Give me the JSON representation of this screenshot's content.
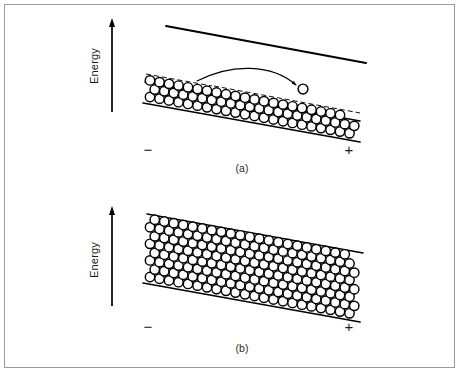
{
  "figure": {
    "width": 460,
    "height": 373,
    "background_color": "#ffffff",
    "border_color": "#9a9a9a",
    "ink_color": "#000000"
  },
  "panels": [
    {
      "id": "a",
      "caption": "(a)",
      "caption_x": 242,
      "caption_y": 172,
      "description": "Partially filled band with one particle excited above the band edge",
      "energy_axis": {
        "label": "Energy",
        "label_x": 98,
        "label_y": 66,
        "arrow_x": 112,
        "arrow_top_y": 18,
        "arrow_bottom_y": 112
      },
      "polarity_left": {
        "sign": "−",
        "x": 148,
        "y": 155
      },
      "polarity_right": {
        "sign": "+",
        "x": 349,
        "y": 155
      },
      "vacuum_line": {
        "x1": 166,
        "y1": 26,
        "x2": 366,
        "y2": 63
      },
      "band_top_line": {
        "x1": 145,
        "y1": 82,
        "x2": 360,
        "y2": 121,
        "width": 1.5
      },
      "band_bottom_line": {
        "x1": 143,
        "y1": 103,
        "x2": 360,
        "y2": 142,
        "width": 1.7
      },
      "dashed_edge": {
        "x1": 146,
        "y1": 74,
        "x2": 212,
        "y2": 86
      },
      "upper_thin_line": {
        "x1": 214,
        "y1": 86,
        "x2": 360,
        "y2": 113
      },
      "lattice": {
        "circle_radius": 4.7,
        "spacing_x": 9.5,
        "row_offset_y": 8.3,
        "origin_x": 150,
        "origin_y": 97,
        "slope": 0.182,
        "rows": [
          {
            "count": 22,
            "shift_x": 0.0
          },
          {
            "count": 22,
            "shift_x": 4.75
          },
          {
            "count": 21,
            "shift_x": 0.0
          }
        ]
      },
      "free_particle": {
        "cx": 303,
        "cy": 89,
        "r": 4.9
      },
      "transition_arrow": {
        "start_x": 197,
        "start_y": 81,
        "control1_x": 232,
        "control1_y": 63,
        "control2_x": 272,
        "control2_y": 64,
        "end_x": 296,
        "end_y": 85,
        "head_size": 4.6
      }
    },
    {
      "id": "b",
      "caption": "(b)",
      "caption_x": 242,
      "caption_y": 352,
      "description": "Completely filled band, no available states",
      "energy_axis": {
        "label": "Energy",
        "label_x": 98,
        "label_y": 260,
        "arrow_x": 112,
        "arrow_top_y": 206,
        "arrow_bottom_y": 306
      },
      "polarity_left": {
        "sign": "−",
        "x": 148,
        "y": 332
      },
      "polarity_right": {
        "sign": "+",
        "x": 349,
        "y": 332
      },
      "band_top_line": {
        "x1": 147,
        "y1": 214,
        "x2": 363,
        "y2": 253,
        "width": 1.5
      },
      "band_bottom_line": {
        "x1": 143,
        "y1": 283,
        "x2": 360,
        "y2": 322,
        "width": 1.7
      },
      "lattice": {
        "circle_radius": 4.7,
        "spacing_x": 9.5,
        "row_offset_y": 8.3,
        "origin_x": 150,
        "origin_y": 277,
        "slope": 0.182,
        "rows": [
          {
            "count": 22,
            "shift_x": 0.0
          },
          {
            "count": 22,
            "shift_x": 4.75
          },
          {
            "count": 22,
            "shift_x": 0.0
          },
          {
            "count": 22,
            "shift_x": 4.75
          },
          {
            "count": 22,
            "shift_x": 0.0
          },
          {
            "count": 22,
            "shift_x": 4.75
          },
          {
            "count": 22,
            "shift_x": 0.0
          },
          {
            "count": 21,
            "shift_x": 4.75
          }
        ]
      }
    }
  ]
}
